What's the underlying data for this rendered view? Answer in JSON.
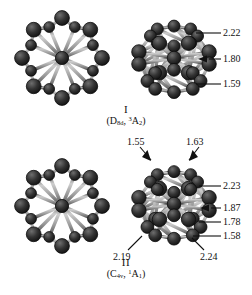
{
  "figure": {
    "background": "#ffffff",
    "atom_color": "#262626",
    "atom_highlight": "#6e6e6e",
    "bond_color": "#a8a8a8",
    "bond_edge": "#3a3a3a",
    "line_color": "#111111"
  },
  "isomer_one": {
    "roman": "I",
    "term_symbol": {
      "point_group": "D",
      "point_group_sub": "8d",
      "separator": ", ",
      "multiplicity": "3",
      "state": "A",
      "state_sub": "2"
    },
    "views": {
      "axial_label": "axial-view-isomer-i",
      "tilted_label": "tilted-view-isomer-i"
    },
    "measurements": [
      {
        "value": "2.22",
        "marker": "line"
      },
      {
        "value": "1.80",
        "marker": "arrow"
      },
      {
        "value": "1.59",
        "marker": "line"
      }
    ]
  },
  "isomer_two": {
    "roman": "II",
    "term_symbol": {
      "point_group": "C",
      "point_group_sub": "4v",
      "separator": ", ",
      "multiplicity": "1",
      "state": "A",
      "state_sub": "1"
    },
    "views": {
      "axial_label": "axial-view-isomer-ii",
      "tilted_label": "tilted-view-isomer-ii"
    },
    "measurements_top": [
      {
        "value": "1.55",
        "marker": "arrow"
      },
      {
        "value": "1.63",
        "marker": "arrow"
      }
    ],
    "measurements_right": [
      {
        "value": "2.23",
        "marker": "line"
      },
      {
        "value": "1.87",
        "marker": "arrow"
      },
      {
        "value": "1.78",
        "marker": "line"
      },
      {
        "value": "1.58",
        "marker": "line"
      }
    ],
    "measurements_bottom": [
      {
        "value": "2.19",
        "marker": "line"
      },
      {
        "value": "2.24",
        "marker": "line"
      }
    ]
  }
}
